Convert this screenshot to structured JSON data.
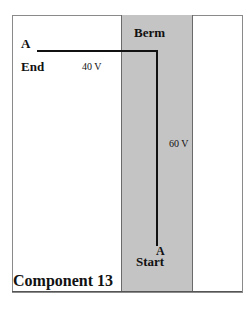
{
  "diagram": {
    "title": "Component 13",
    "region_label": "Berm",
    "path": {
      "start_marker": "A",
      "start_label": "Start",
      "end_marker": "A",
      "end_label": "End",
      "segments": [
        {
          "orientation": "vertical",
          "label": "60 V"
        },
        {
          "orientation": "horizontal",
          "label": "40 V"
        }
      ]
    },
    "colors": {
      "berm_fill": "#c4c4c4",
      "line": "#111111",
      "frame": "#8a8a8a"
    }
  }
}
